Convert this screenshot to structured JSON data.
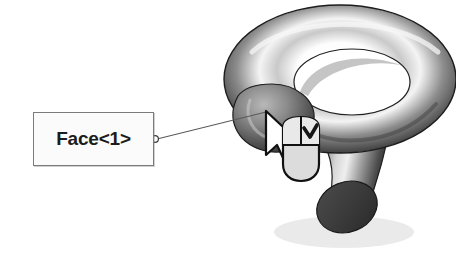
{
  "scene": {
    "title": "Face selection callout on 3D hook model",
    "background_color": "#ffffff"
  },
  "callout": {
    "label": "Face<1>",
    "box": {
      "fill_color": "#fbfbfb",
      "border_color": "#7b7b7b",
      "x": 33,
      "y": 112,
      "width": 121,
      "height": 54
    },
    "leader": {
      "anchor_color": "#4a4a4a",
      "line_color": "#5a5a5a",
      "start_x": 154,
      "start_y": 139,
      "end_x": 266,
      "end_y": 112
    }
  },
  "model": {
    "name": "hook-torus-solid",
    "shading": "grayscale-gradient",
    "highlight_color": "#f2f2f2",
    "midtone_color": "#8f8f8f",
    "shadow_color": "#2b2b2b",
    "end_cap_color": "#3a3a3a"
  },
  "cursor": {
    "name": "arrow-pointer",
    "fill_color": "#ffffff",
    "outline_color": "#111111",
    "tip_x": 266,
    "tip_y": 112
  },
  "mouse_icon": {
    "name": "mouse-right-button-checkmark",
    "body_fill": "#d9d9d9",
    "button_fill": "#e6e6e6",
    "outline_color": "#111111",
    "check_color": "#1a1a1a",
    "check_button": "right",
    "x": 281,
    "y": 118,
    "width": 40,
    "height": 65
  }
}
